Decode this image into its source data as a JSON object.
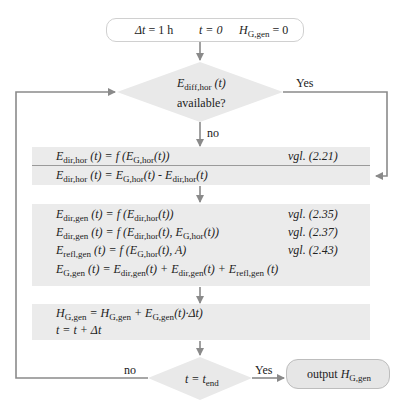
{
  "start": {
    "dt": "Δt = 1 h",
    "t0": "t = 0",
    "H_main": "H",
    "H_sub": "G,gen",
    "H_rest": " = 0"
  },
  "decision1": {
    "E": "E",
    "E_sub": "diff,hor",
    "E_arg": " (t)",
    "line2": "available?",
    "yes_label": "Yes",
    "no_label": "no"
  },
  "block1": {
    "row1": {
      "lhs": "E",
      "lhs_sub": "dir,hor",
      "rhs": " (t) = f (E",
      "rhs_sub": "G,hor",
      "tail": "(t))",
      "ref": "vgl. (2.21)"
    },
    "row2": {
      "lhs": "E",
      "lhs_sub": "dir,hor",
      "mid": " (t) = E",
      "mid_sub": "G,hor",
      "mid2": "(t) - E",
      "mid2_sub": "dir,hor",
      "tail": "(t)"
    }
  },
  "block2": {
    "row1": {
      "text": "E_dir,gen (t) = f (E_dir,hor(t))",
      "ref": "vgl. (2.35)"
    },
    "row2": {
      "text": "E_dir,gen (t) = f (E_dir,hor(t), E_G,hor(t))",
      "ref": "vgl. (2.37)"
    },
    "row3": {
      "text": "E_refl,gen (t) = f (E_G,hor(t), A)",
      "ref": "vgl. (2.43)"
    },
    "row4": {
      "text": "E_G,gen (t) = E_dir,gen(t) + E_dir,gen(t) + E_refl,gen (t)"
    }
  },
  "block3": {
    "row1": "H_G,gen = H_G,gen + E_G,gen(t)·Δt)",
    "row2": "t = t + Δt"
  },
  "decision2": {
    "text": "t = t_end",
    "yes_label": "Yes",
    "no_label": "no"
  },
  "output": {
    "label": "output",
    "H": "H",
    "H_sub": "G,gen"
  }
}
